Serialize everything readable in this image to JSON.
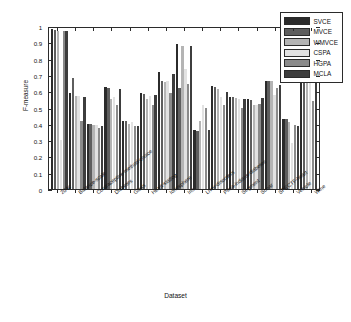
{
  "chart_data": {
    "type": "bar",
    "title": "",
    "xlabel": "Dataset",
    "ylabel": "F-measure",
    "ylim": [
      0,
      1
    ],
    "ytick_labels": [
      "0",
      "0.1",
      "0.2",
      "0.3",
      "0.4",
      "0.5",
      "0.6",
      "0.7",
      "0.8",
      "0.9",
      "1"
    ],
    "ytick_values": [
      0,
      0.1,
      0.2,
      0.3,
      0.4,
      0.5,
      0.6,
      0.7,
      0.8,
      0.9,
      1
    ],
    "grid": false,
    "legend_position": "top-right",
    "legend_entries": [
      "SVCE",
      "MVCE",
      "WMVCE",
      "CSPA",
      "HGPA",
      "MCLA"
    ],
    "series_colors": [
      "#2b2b2b",
      "#5e5e5e",
      "#b4b4b4",
      "#e2e2e2",
      "#8a8a8a",
      "#3d3d3d"
    ],
    "categories": [
      "2d4c",
      "Balance-scale",
      "Contraceptive-method-choice",
      "Diabetes",
      "Glass",
      "Heart-statlog",
      "Ionosphere",
      "Iris",
      "Liver-disorders",
      "Pima-indians-diabetes",
      "Segment",
      "Sonar",
      "SPECTF-heart",
      "Vehicle",
      "Wine"
    ],
    "series": [
      {
        "name": "SVCE",
        "values": [
          0.98,
          0.59,
          0.4,
          0.625,
          0.42,
          0.59,
          0.715,
          0.89,
          0.36,
          0.63,
          0.565,
          0.55,
          0.665,
          0.43,
          0.7
        ]
      },
      {
        "name": "MVCE",
        "values": [
          0.975,
          0.68,
          0.4,
          0.62,
          0.42,
          0.585,
          0.66,
          0.62,
          0.355,
          0.625,
          0.565,
          0.545,
          0.665,
          0.43,
          0.69
        ]
      },
      {
        "name": "WMVCE",
        "values": [
          0.97,
          0.57,
          0.395,
          0.555,
          0.4,
          0.555,
          0.655,
          0.88,
          0.42,
          0.615,
          0.56,
          0.515,
          0.66,
          0.41,
          0.68
        ]
      },
      {
        "name": "CSPA",
        "values": [
          0.302,
          0.57,
          0.39,
          0.565,
          0.41,
          0.57,
          0.66,
          0.735,
          0.515,
          0.565,
          0.55,
          0.515,
          0.575,
          0.285,
          0.68
        ]
      },
      {
        "name": "HGPA",
        "values": [
          0.97,
          0.418,
          0.375,
          0.515,
          0.385,
          0.515,
          0.59,
          0.645,
          0.5,
          0.515,
          0.5,
          0.52,
          0.62,
          0.39,
          0.54
        ]
      },
      {
        "name": "MCLA",
        "values": [
          0.968,
          0.565,
          0.385,
          0.615,
          0.385,
          0.575,
          0.705,
          0.88,
          0.36,
          0.595,
          0.555,
          0.56,
          0.64,
          0.385,
          0.68
        ]
      }
    ]
  }
}
